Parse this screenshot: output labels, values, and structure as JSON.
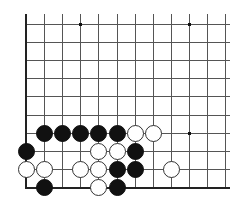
{
  "board": {
    "origin_x": 26,
    "origin_y": 24,
    "spacing": 18.1,
    "cols": 12,
    "rows": 10,
    "line_end_x": 230,
    "line_top_y": 14,
    "edges": [
      "left",
      "bottom"
    ],
    "colors": {
      "background": "#ffffff",
      "line": "#555555",
      "edge": "#222222",
      "black": "#111111",
      "white": "#ffffff"
    },
    "star_points": [
      {
        "col": 3,
        "row": 0
      },
      {
        "col": 9,
        "row": 0
      },
      {
        "col": 9,
        "row": 6
      }
    ],
    "stones": [
      {
        "color": "black",
        "col": 1,
        "row": 6
      },
      {
        "color": "black",
        "col": 2,
        "row": 6
      },
      {
        "color": "black",
        "col": 3,
        "row": 6
      },
      {
        "color": "black",
        "col": 4,
        "row": 6
      },
      {
        "color": "black",
        "col": 5,
        "row": 6
      },
      {
        "color": "white",
        "col": 6,
        "row": 6
      },
      {
        "color": "white",
        "col": 7,
        "row": 6
      },
      {
        "color": "black",
        "col": 0,
        "row": 7
      },
      {
        "color": "white",
        "col": 4,
        "row": 7
      },
      {
        "color": "white",
        "col": 5,
        "row": 7
      },
      {
        "color": "black",
        "col": 6,
        "row": 7
      },
      {
        "color": "white",
        "col": 0,
        "row": 8
      },
      {
        "color": "white",
        "col": 1,
        "row": 8
      },
      {
        "color": "white",
        "col": 3,
        "row": 8
      },
      {
        "color": "white",
        "col": 4,
        "row": 8
      },
      {
        "color": "black",
        "col": 5,
        "row": 8
      },
      {
        "color": "black",
        "col": 6,
        "row": 8
      },
      {
        "color": "white",
        "col": 8,
        "row": 8
      },
      {
        "color": "black",
        "col": 1,
        "row": 9
      },
      {
        "color": "white",
        "col": 4,
        "row": 9
      },
      {
        "color": "black",
        "col": 5,
        "row": 9
      }
    ]
  }
}
